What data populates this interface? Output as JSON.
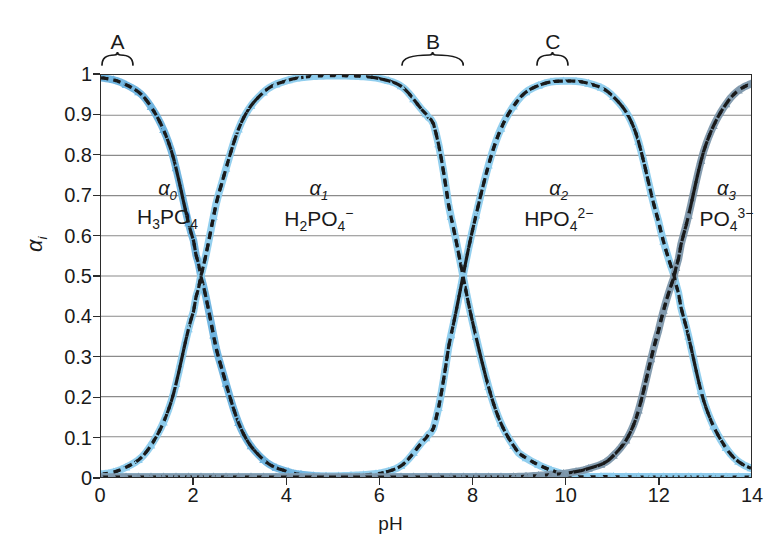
{
  "chart_data": {
    "type": "line",
    "title": "",
    "xlabel": "pH",
    "ylabel": "αi",
    "xlim": [
      0,
      14
    ],
    "ylim": [
      0,
      1
    ],
    "grid": true,
    "legend_position": "inline-annotations",
    "xticks": [
      "0",
      "2",
      "4",
      "6",
      "8",
      "10",
      "12",
      "14"
    ],
    "xtick_values": [
      0,
      2,
      4,
      6,
      8,
      10,
      12,
      14
    ],
    "yticks": [
      "0",
      "0.1",
      "0.2",
      "0.3",
      "0.4",
      "0.5",
      "0.6",
      "0.7",
      "0.8",
      "0.9",
      "1"
    ],
    "ytick_values": [
      0,
      0.1,
      0.2,
      0.3,
      0.4,
      0.5,
      0.6,
      0.7,
      0.8,
      0.9,
      1
    ],
    "pka_values": [
      2.15,
      7.2,
      12.35
    ],
    "crossings": [
      {
        "ph": 2.15,
        "alpha": 0.5,
        "between": [
          "α0",
          "α1"
        ]
      },
      {
        "ph": 7.2,
        "alpha": 0.5,
        "between": [
          "α1",
          "α2"
        ]
      },
      {
        "ph": 12.35,
        "alpha": 0.5,
        "between": [
          "α2",
          "α3"
        ]
      }
    ],
    "series": [
      {
        "name": "α0",
        "formula": "H3PO4",
        "color": "#6db4e0",
        "x": [
          0,
          0.5,
          1,
          1.5,
          2,
          2.15,
          2.5,
          3,
          3.5,
          4,
          4.5,
          5,
          5.5,
          6,
          7,
          8,
          9,
          10,
          11,
          12,
          13,
          14
        ],
        "values": [
          0.993,
          0.978,
          0.934,
          0.817,
          0.586,
          0.5,
          0.309,
          0.124,
          0.043,
          0.014,
          0.004,
          0.001,
          0.0,
          0.0,
          0.0,
          0.0,
          0.0,
          0.0,
          0.0,
          0.0,
          0.0,
          0.0
        ]
      },
      {
        "name": "α1",
        "formula": "H2PO4-",
        "color": "#8ecdee",
        "x": [
          0,
          0.5,
          1,
          1.5,
          2,
          2.15,
          2.5,
          3,
          3.5,
          4,
          4.5,
          5,
          5.5,
          6,
          6.5,
          7,
          7.2,
          7.5,
          8,
          8.5,
          9,
          10,
          11,
          12,
          13,
          14
        ],
        "values": [
          0.007,
          0.022,
          0.066,
          0.183,
          0.414,
          0.5,
          0.691,
          0.876,
          0.957,
          0.986,
          0.996,
          0.998,
          0.997,
          0.991,
          0.969,
          0.903,
          0.861,
          0.666,
          0.387,
          0.167,
          0.059,
          0.006,
          0.001,
          0.0,
          0.0,
          0.0
        ]
      },
      {
        "name": "α2",
        "formula": "HPO42-",
        "color": "#8ecdee",
        "x": [
          0,
          1,
          2,
          3,
          4,
          5,
          6,
          6.5,
          7,
          7.2,
          7.5,
          8,
          8.5,
          9,
          9.5,
          10,
          10.5,
          11,
          11.5,
          12,
          12.35,
          12.5,
          13,
          13.5,
          14
        ],
        "values": [
          0.0,
          0.0,
          0.0,
          0.0,
          0.0,
          0.002,
          0.009,
          0.031,
          0.097,
          0.139,
          0.334,
          0.613,
          0.833,
          0.94,
          0.977,
          0.985,
          0.979,
          0.95,
          0.862,
          0.64,
          0.5,
          0.414,
          0.183,
          0.066,
          0.022
        ]
      },
      {
        "name": "α3",
        "formula": "PO43-",
        "color": "#7f98ac",
        "x": [
          0,
          2,
          4,
          6,
          8,
          9,
          10,
          10.5,
          11,
          11.5,
          12,
          12.35,
          12.5,
          13,
          13.5,
          14
        ],
        "values": [
          0.0,
          0.0,
          0.0,
          0.0,
          0.0,
          0.001,
          0.009,
          0.021,
          0.049,
          0.138,
          0.36,
          0.5,
          0.586,
          0.817,
          0.934,
          0.978
        ]
      }
    ],
    "annotations": [
      {
        "label": "A",
        "type": "brace",
        "ph_start": 0.0,
        "ph_end": 0.75,
        "ph_center": 0.37
      },
      {
        "label": "B",
        "type": "brace",
        "ph_start": 6.45,
        "ph_end": 7.85,
        "ph_center": 7.15
      },
      {
        "label": "C",
        "type": "brace",
        "ph_start": 9.35,
        "ph_end": 10.1,
        "ph_center": 9.72
      }
    ],
    "species_labels": [
      {
        "alpha": "α0",
        "sub": "0",
        "formula_html": "H<sub>3</sub>PO<sub>4</sub>",
        "ph_center": 1.45
      },
      {
        "alpha": "α1",
        "sub": "1",
        "formula_html": "H<sub>2</sub>PO<sub>4</sub><sup>−</sup>",
        "ph_center": 4.7
      },
      {
        "alpha": "α2",
        "sub": "2",
        "formula_html": "HPO<sub>4</sub><sup>2−</sup>",
        "ph_center": 9.85
      },
      {
        "alpha": "α3",
        "sub": "3",
        "formula_html": "PO<sub>4</sub><sup>3−</sup>",
        "ph_center": 13.45
      }
    ]
  },
  "colors": {
    "frame": "#2b2b2b",
    "grid": "#8a8a8a",
    "curve_line": "#1a1a1a",
    "marker_light": "#8ecdee",
    "marker_mid": "#4f9fd0",
    "marker_gray": "#7f98ac",
    "background": "#ffffff"
  }
}
